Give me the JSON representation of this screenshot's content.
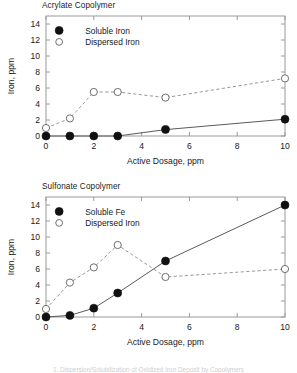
{
  "figure": {
    "caption_partial": "1. Dispersion/Solubilization of Oxidized Iron Deposit by Copolymers"
  },
  "chart_data": [
    {
      "type": "line",
      "title": "Acrylate Copolymer",
      "xlabel": "Active Dosage, ppm",
      "ylabel": "Iron, ppm",
      "xlim": [
        0,
        10
      ],
      "ylim": [
        0,
        15
      ],
      "xticks": [
        0,
        2,
        4,
        6,
        8,
        10
      ],
      "yticks": [
        0,
        2,
        4,
        6,
        8,
        10,
        12,
        14
      ],
      "grid": false,
      "legend_position": "upper-left",
      "x": [
        0,
        1,
        2,
        3,
        5,
        10
      ],
      "series": [
        {
          "name": "Soluble Iron",
          "marker": "filled-circle",
          "linestyle": "solid",
          "values": [
            0,
            0,
            0,
            0,
            0.8,
            2.1
          ]
        },
        {
          "name": "Dispersed Iron",
          "marker": "open-circle",
          "linestyle": "dashed",
          "values": [
            1.0,
            2.2,
            5.5,
            5.5,
            4.8,
            7.2
          ]
        }
      ]
    },
    {
      "type": "line",
      "title": "Sulfonate Copolymer",
      "xlabel": "Active Dosage, ppm",
      "ylabel": "Iron, ppm",
      "xlim": [
        0,
        10
      ],
      "ylim": [
        0,
        15
      ],
      "xticks": [
        0,
        2,
        4,
        6,
        8,
        10
      ],
      "yticks": [
        0,
        2,
        4,
        6,
        8,
        10,
        12,
        14
      ],
      "grid": false,
      "legend_position": "upper-left",
      "x": [
        0,
        1,
        2,
        3,
        5,
        10
      ],
      "series": [
        {
          "name": "Soluble Fe",
          "marker": "filled-circle",
          "linestyle": "solid",
          "values": [
            0,
            0.2,
            1.1,
            3.0,
            7.0,
            14.0
          ]
        },
        {
          "name": "Dispersed Iron",
          "marker": "open-circle",
          "linestyle": "dashed",
          "values": [
            1.0,
            4.3,
            6.2,
            9.0,
            5.0,
            6.0
          ]
        }
      ]
    }
  ]
}
